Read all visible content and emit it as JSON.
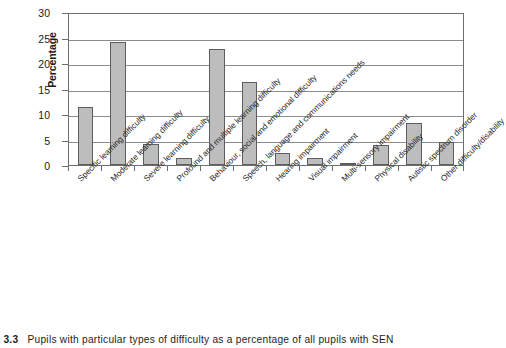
{
  "chart_data": {
    "type": "bar",
    "title": "",
    "xlabel": "",
    "ylabel": "Percentage",
    "ylim": [
      0,
      30
    ],
    "yticks": [
      0,
      5,
      10,
      15,
      20,
      25,
      30
    ],
    "ytick_labels": [
      "0",
      "5",
      "10",
      "15",
      "20",
      "25",
      "30"
    ],
    "grid": true,
    "legend": "none",
    "bar_color": "#bdbdbd",
    "bar_border_color": "#5d5d5d",
    "categories": [
      "Specific learning difficulty",
      "Moderate learning difficulty",
      "Severe learning difficulty",
      "Profound and multiple learning difficulty",
      "Behaviour, social and emotional difficulty",
      "Speech, language and communications needs",
      "Hearing impairment",
      "Visual impairment",
      "Multi-sensory impairment",
      "Physical disability",
      "Autistic spectrum disorder",
      "Other difficulty/disability"
    ],
    "values": [
      11.4,
      24.2,
      4.2,
      1.4,
      22.7,
      16.3,
      2.3,
      1.3,
      0.2,
      3.9,
      8.2,
      4.6
    ]
  },
  "caption": {
    "number": "ure 3.3",
    "text": "Pupils with particular types of difficulty as a percentage of all pupils with SEN"
  }
}
